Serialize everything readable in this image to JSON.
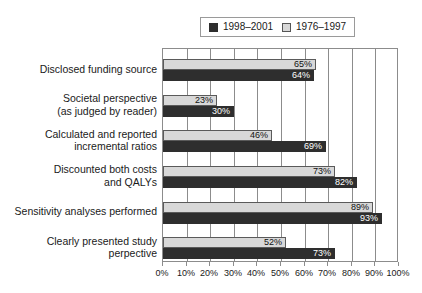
{
  "chart_data": {
    "type": "bar",
    "orientation": "horizontal",
    "title": "",
    "xlabel": "",
    "ylabel": "",
    "xlim": [
      0,
      100
    ],
    "grid": true,
    "legend_position": "top",
    "xticks": [
      "0%",
      "10%",
      "20%",
      "30%",
      "40%",
      "50%",
      "60%",
      "70%",
      "80%",
      "90%",
      "100%"
    ],
    "xtick_values": [
      0,
      10,
      20,
      30,
      40,
      50,
      60,
      70,
      80,
      90,
      100
    ],
    "categories": [
      "Disclosed funding source",
      "Societal perspective (as judged by reader)",
      "Calculated and reported incremental ratios",
      "Discounted both costs and QALYs",
      "Sensitivity analyses performed",
      "Clearly presented study perpective"
    ],
    "category_lines": [
      [
        "Disclosed funding source"
      ],
      [
        "Societal perspective",
        "(as judged by reader)"
      ],
      [
        "Calculated and reported",
        "incremental ratios"
      ],
      [
        "Discounted both costs",
        "and QALYs"
      ],
      [
        "Sensitivity analyses performed"
      ],
      [
        "Clearly presented study",
        "perpective"
      ]
    ],
    "series": [
      {
        "name": "1976–1997",
        "color": "#d8d8d8",
        "values": [
          65,
          23,
          46,
          73,
          89,
          52
        ],
        "labels": [
          "65%",
          "23%",
          "46%",
          "73%",
          "89%",
          "52%"
        ]
      },
      {
        "name": "1998–2001",
        "color": "#2e2e2e",
        "values": [
          64,
          30,
          69,
          82,
          93,
          73
        ],
        "labels": [
          "64%",
          "30%",
          "69%",
          "82%",
          "93%",
          "73%"
        ]
      }
    ]
  },
  "legend": {
    "entries": [
      {
        "label": "1998–2001",
        "swatch": "dark-swatch-icon"
      },
      {
        "label": "1976–1997",
        "swatch": "light-swatch-icon"
      }
    ]
  },
  "colors": {
    "dark_series": "#2e2e2e",
    "light_series": "#d8d8d8",
    "axis": "#8c8c8c",
    "text": "#1a1a1a",
    "background": "#ffffff"
  }
}
